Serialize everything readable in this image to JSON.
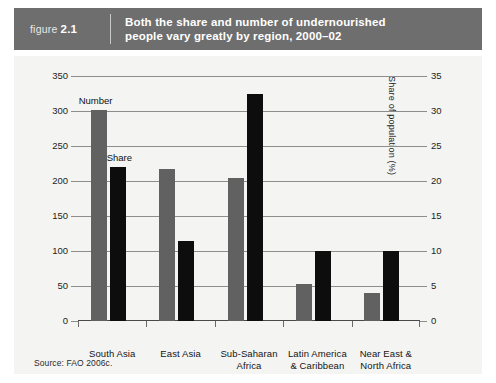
{
  "figure": {
    "word": "figure",
    "number": "2.1",
    "title_line1": "Both the share and number of undernourished",
    "title_line2": "people vary greatly by region, 2000–02",
    "header_color": "#6e6e6e",
    "panel_color": "#f4f4f2"
  },
  "source": "Source: FAO 2006c.",
  "annotations": {
    "number_label": "Number",
    "share_label": "Share"
  },
  "chart_data": {
    "type": "bar",
    "title": "Both the share and number of undernourished people vary greatly by region, 2000–02",
    "categories": [
      "South Asia",
      "East Asia",
      "Sub-Saharan Africa",
      "Latin America & Caribbean",
      "Near East & North Africa"
    ],
    "category_lines": [
      [
        "South Asia"
      ],
      [
        "East Asia"
      ],
      [
        "Sub-Saharan",
        "Africa"
      ],
      [
        "Latin America",
        "& Caribbean"
      ],
      [
        "Near East &",
        "North Africa"
      ]
    ],
    "series": [
      {
        "name": "Number",
        "axis": "left",
        "color": "#616161",
        "unit": "millions of people",
        "values": [
          301,
          217,
          204,
          53,
          40
        ]
      },
      {
        "name": "Share",
        "axis": "right",
        "color": "#0d0d0d",
        "unit": "percent of population",
        "values": [
          22,
          11.5,
          32.5,
          10,
          10
        ]
      }
    ],
    "xlabel": "",
    "ylabel": "Millions of people",
    "ylabel_right": "Share of population (%)",
    "ylim": [
      0,
      350
    ],
    "yticks": [
      0,
      50,
      100,
      150,
      200,
      250,
      300,
      350
    ],
    "ylim_right": [
      0,
      35
    ],
    "yticks_right": [
      0,
      5,
      10,
      15,
      20,
      25,
      30,
      35
    ],
    "grid": true,
    "legend": "inline-annotations"
  }
}
